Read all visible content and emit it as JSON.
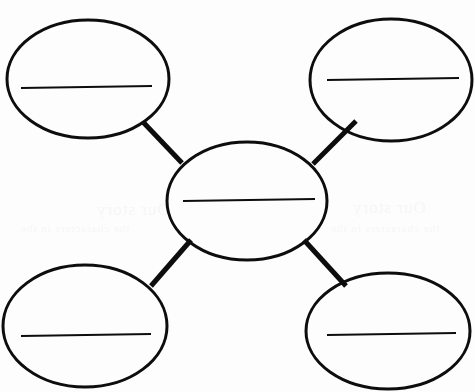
{
  "worksheet": {
    "kind": "concept-map-graphic-organizer",
    "title": "Blank Cluster / Web Graphic Organizer",
    "description": "A photocopied blank graphic organizer worksheet: one central oval connected by four thick straight spokes to four outer ovals, each oval containing a single horizontal writing line.",
    "width": 475,
    "height": 392,
    "background_color": "#fdfdfd",
    "ink_color": "#0d0d0d",
    "oval_stroke_width": 3,
    "writing_line_stroke_width": 2.2,
    "connector_stroke_width": 5
  },
  "nodes": [
    {
      "id": "center",
      "data_name": "center-oval",
      "role": "main-topic",
      "label": "",
      "cx": 247,
      "cy": 201,
      "rx": 80,
      "ry": 59,
      "writing_line": {
        "x1": 183,
        "y1": 201,
        "x2": 315,
        "y2": 199
      }
    },
    {
      "id": "top-left",
      "data_name": "top-left-oval",
      "role": "detail",
      "label": "",
      "cx": 88,
      "cy": 79,
      "rx": 81,
      "ry": 59,
      "writing_line": {
        "x1": 21,
        "y1": 88,
        "x2": 152,
        "y2": 86
      }
    },
    {
      "id": "top-right",
      "data_name": "top-right-oval",
      "role": "detail",
      "label": "",
      "cx": 391,
      "cy": 80,
      "rx": 81,
      "ry": 61,
      "writing_line": {
        "x1": 327,
        "y1": 80,
        "x2": 459,
        "y2": 78
      }
    },
    {
      "id": "bottom-left",
      "data_name": "bottom-left-oval",
      "role": "detail",
      "label": "",
      "cx": 85,
      "cy": 326,
      "rx": 82,
      "ry": 61,
      "writing_line": {
        "x1": 21,
        "y1": 336,
        "x2": 151,
        "y2": 334
      }
    },
    {
      "id": "bottom-right",
      "data_name": "bottom-right-oval",
      "role": "detail",
      "label": "",
      "cx": 388,
      "cy": 331,
      "rx": 82,
      "ry": 58,
      "writing_line": {
        "x1": 327,
        "y1": 335,
        "x2": 456,
        "y2": 333
      }
    }
  ],
  "connectors": [
    {
      "id": "c-tl",
      "data_name": "connector-center-to-top-left",
      "from": "top-left",
      "to": "center",
      "x1": 143,
      "y1": 122,
      "x2": 182,
      "y2": 163
    },
    {
      "id": "c-tr",
      "data_name": "connector-center-to-top-right",
      "from": "top-right",
      "to": "center",
      "x1": 356,
      "y1": 121,
      "x2": 313,
      "y2": 164
    },
    {
      "id": "c-bl",
      "data_name": "connector-center-to-bottom-left",
      "from": "center",
      "to": "bottom-left",
      "x1": 191,
      "y1": 240,
      "x2": 151,
      "y2": 286
    },
    {
      "id": "c-br",
      "data_name": "connector-center-to-bottom-right",
      "from": "center",
      "to": "bottom-right",
      "x1": 304,
      "y1": 240,
      "x2": 346,
      "y2": 286
    }
  ],
  "ghost_text": {
    "note": "Barely visible bleed-through from the reverse side of the photocopied page; not legible content.",
    "line1": "Our story",
    "line2": "the characters in the",
    "line3": "Our story",
    "line4": "the characters in the"
  }
}
